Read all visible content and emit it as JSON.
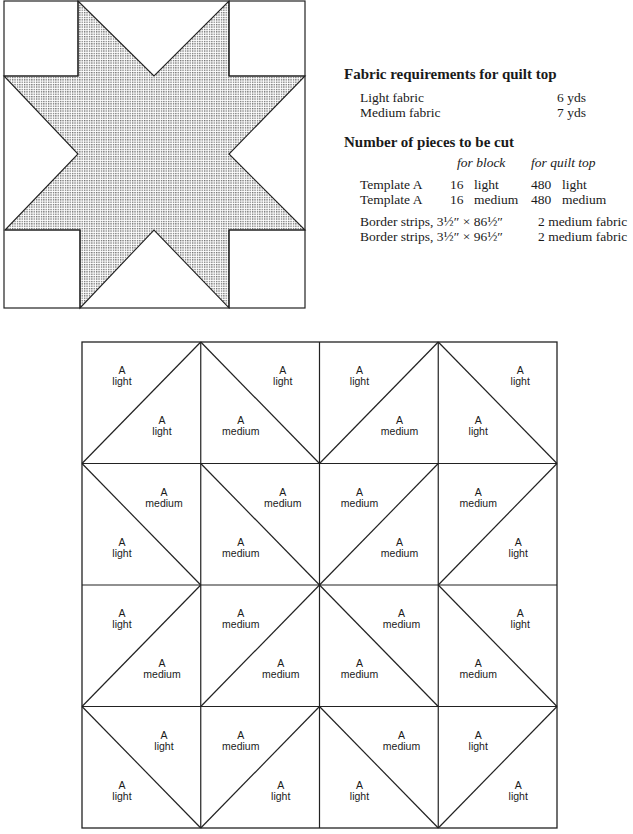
{
  "fabric_requirements": {
    "heading": "Fabric requirements for quilt top",
    "items": [
      {
        "label": "Light fabric",
        "amount": "6 yds"
      },
      {
        "label": "Medium fabric",
        "amount": "7 yds"
      }
    ]
  },
  "pieces": {
    "heading": "Number of pieces to be cut",
    "col_block": "for block",
    "col_quilt": "for quilt top",
    "templates": [
      {
        "name": "Template A",
        "block_count": "16",
        "block_color": "light",
        "quilt_count": "480",
        "quilt_color": "light"
      },
      {
        "name": "Template A",
        "block_count": "16",
        "block_color": "medium",
        "quilt_count": "480",
        "quilt_color": "medium"
      }
    ],
    "borders": [
      {
        "label": "Border strips, 3½″ × 86½″",
        "qty": "2 medium fabric"
      },
      {
        "label": "Border strips, 3½″ × 96½″",
        "qty": "2 medium fabric"
      }
    ]
  },
  "star_block": {
    "fill": "stippled gray",
    "description": "Eight-pointed star quilt block"
  },
  "grid": {
    "rows": 4,
    "cols": 4,
    "template_letter": "A",
    "cells": [
      [
        {
          "diag": "/",
          "first": "light",
          "second": "light"
        },
        {
          "diag": "\\",
          "first": "light",
          "second": "medium"
        },
        {
          "diag": "/",
          "first": "light",
          "second": "medium"
        },
        {
          "diag": "\\",
          "first": "light",
          "second": "light"
        }
      ],
      [
        {
          "diag": "\\",
          "first": "medium",
          "second": "light"
        },
        {
          "diag": "\\",
          "first": "medium",
          "second": "medium"
        },
        {
          "diag": "/",
          "first": "medium",
          "second": "medium"
        },
        {
          "diag": "/",
          "first": "medium",
          "second": "light"
        }
      ],
      [
        {
          "diag": "/",
          "first": "light",
          "second": "medium"
        },
        {
          "diag": "/",
          "first": "medium",
          "second": "medium"
        },
        {
          "diag": "\\",
          "first": "medium",
          "second": "medium"
        },
        {
          "diag": "\\",
          "first": "light",
          "second": "medium"
        }
      ],
      [
        {
          "diag": "\\",
          "first": "light",
          "second": "light"
        },
        {
          "diag": "/",
          "first": "medium",
          "second": "light"
        },
        {
          "diag": "\\",
          "first": "medium",
          "second": "light"
        },
        {
          "diag": "/",
          "first": "light",
          "second": "light"
        }
      ]
    ]
  }
}
